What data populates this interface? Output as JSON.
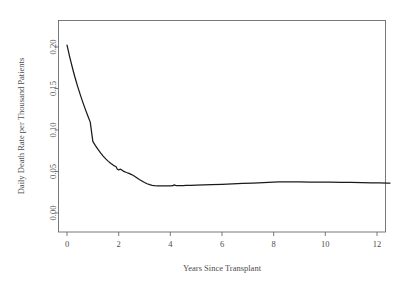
{
  "chart_data": {
    "type": "line",
    "title": "",
    "xlabel": "Years Since Transplant",
    "ylabel": "Daily Death Rate per Thousand Patients",
    "xlim": [
      -0.35,
      12.9
    ],
    "ylim": [
      0.0,
      0.2245
    ],
    "grid": false,
    "legend": null,
    "xticks": [
      0,
      2,
      4,
      6,
      8,
      10,
      12
    ],
    "xtick_labels": [
      "0",
      "2",
      "4",
      "6",
      "8",
      "10",
      "12"
    ],
    "yticks": [
      0.0,
      0.05,
      0.1,
      0.15,
      0.2
    ],
    "ytick_labels": [
      "0.00",
      "0.05",
      "0.10",
      "0.15",
      "0.20"
    ],
    "line_color": "#1a1a1a",
    "axis_color": "#6b6b6b",
    "background_color": "#ffffff",
    "series": [
      {
        "name": "Daily death rate",
        "x": [
          0.0,
          0.05,
          0.1,
          0.15,
          0.2,
          0.25,
          0.3,
          0.35,
          0.4,
          0.5,
          0.6,
          0.7,
          0.8,
          0.9,
          1.0,
          1.1,
          1.2,
          1.3,
          1.4,
          1.5,
          1.6,
          1.7,
          1.8,
          1.85,
          1.9,
          1.95,
          2.0,
          2.05,
          2.1,
          2.15,
          2.2,
          2.3,
          2.4,
          2.5,
          2.6,
          2.7,
          2.8,
          2.9,
          3.0,
          3.1,
          3.2,
          3.3,
          3.4,
          3.5,
          3.6,
          3.7,
          3.8,
          3.9,
          4.0,
          4.1,
          4.15,
          4.2,
          4.25,
          4.3,
          4.4,
          4.5,
          4.6,
          4.8,
          5.0,
          5.3,
          5.6,
          6.0,
          6.4,
          6.8,
          7.2,
          7.6,
          8.0,
          8.2,
          8.4,
          8.7,
          9.0,
          9.4,
          9.8,
          10.2,
          10.6,
          11.0,
          11.4,
          11.8,
          12.1,
          12.4,
          12.5
        ],
        "y": [
          0.2022,
          0.1955,
          0.1888,
          0.1824,
          0.1762,
          0.1702,
          0.1645,
          0.159,
          0.1538,
          0.1438,
          0.1345,
          0.1258,
          0.1175,
          0.1095,
          0.0862,
          0.0812,
          0.0766,
          0.0724,
          0.0686,
          0.0652,
          0.0622,
          0.0596,
          0.0574,
          0.0566,
          0.0558,
          0.0528,
          0.0519,
          0.0528,
          0.0522,
          0.0512,
          0.0501,
          0.0488,
          0.0478,
          0.0463,
          0.0446,
          0.0425,
          0.0404,
          0.0386,
          0.0368,
          0.0352,
          0.0341,
          0.0334,
          0.0329,
          0.0327,
          0.0326,
          0.0326,
          0.0326,
          0.0327,
          0.0328,
          0.0329,
          0.0339,
          0.0332,
          0.0329,
          0.0329,
          0.033,
          0.0331,
          0.0332,
          0.0334,
          0.0336,
          0.0339,
          0.0342,
          0.0346,
          0.0351,
          0.0356,
          0.0361,
          0.0366,
          0.0372,
          0.0374,
          0.0375,
          0.0375,
          0.0374,
          0.0373,
          0.0372,
          0.0371,
          0.037,
          0.0369,
          0.0367,
          0.0364,
          0.0362,
          0.036,
          0.0359
        ]
      }
    ],
    "annotations": [
      {
        "label": "initial peak rate",
        "x": 0.0,
        "y": 0.2022
      },
      {
        "label": "shoulder near year 2",
        "x": 2.0,
        "y": 0.0519
      },
      {
        "label": "minimum rate",
        "x": 3.6,
        "y": 0.0326
      },
      {
        "label": "late plateau peak",
        "x": 8.3,
        "y": 0.0375
      }
    ]
  },
  "axes": {
    "y_title": "Daily Death Rate per Thousand Patients",
    "x_title": "Years Since Transplant",
    "y_labels": [
      "0.00",
      "0.05",
      "0.10",
      "0.15",
      "0.20"
    ],
    "x_labels": [
      "0",
      "2",
      "4",
      "6",
      "8",
      "10",
      "12"
    ]
  }
}
